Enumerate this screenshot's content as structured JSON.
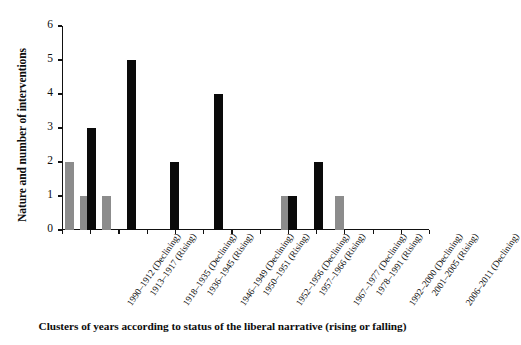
{
  "chart_data": {
    "type": "bar",
    "title": "",
    "xlabel": "Clusters of years according to status of the liberal narrative (rising or falling)",
    "ylabel": "Nature and number of interventions",
    "ylim": [
      0,
      6
    ],
    "yticks": [
      0,
      1,
      2,
      3,
      4,
      5,
      6
    ],
    "grid": false,
    "legend": "none",
    "categories": [
      "1990–1912 (Declining)",
      "1913–1917 (Rising)",
      "1918–1935 (Declining)",
      "1936–1945 (Rising)",
      "1946–1949 (Declining)",
      "1950–1951 (Rising)",
      "1952–1956 (Declining)",
      "1957–1966 (Rising)",
      "1967–1977 (Declining)",
      "1978–1991 (Rising)",
      "1992–2000 (Declining)",
      "2001–2005 (Rising)",
      "2006–2011 (Declining)"
    ],
    "series": [
      {
        "name": "Declining",
        "color": "#8c8c8c",
        "values": [
          2,
          1,
          1,
          0,
          0,
          0,
          0,
          0,
          0,
          0,
          1,
          0,
          1
        ]
      },
      {
        "name": "Rising",
        "color": "#0a0a0a",
        "values": [
          0,
          3,
          0,
          5,
          0,
          2,
          0,
          4,
          0,
          0,
          1,
          2,
          0
        ]
      }
    ],
    "bars": [
      {
        "category_index": 0,
        "status": "Declining",
        "value": 2,
        "color": "#8c8c8c",
        "x_pct": 3.0
      },
      {
        "category_index": 1,
        "status": "Declining",
        "value": 1,
        "color": "#8c8c8c",
        "x_pct": 18.0
      },
      {
        "category_index": 1,
        "status": "Rising",
        "value": 3,
        "color": "#0a0a0a",
        "x_pct": 25.0
      },
      {
        "category_index": 2,
        "status": "Declining",
        "value": 1,
        "color": "#8c8c8c",
        "x_pct": 39.5
      },
      {
        "category_index": 3,
        "status": "Rising",
        "value": 5,
        "color": "#0a0a0a",
        "x_pct": 65.0
      },
      {
        "category_index": 5,
        "status": "Rising",
        "value": 2,
        "color": "#0a0a0a",
        "x_pct": 108.0
      },
      {
        "category_index": 7,
        "status": "Rising",
        "value": 4,
        "color": "#0a0a0a",
        "x_pct": 152.0
      },
      {
        "category_index": 10,
        "status": "Declining",
        "value": 1,
        "color": "#8c8c8c",
        "x_pct": 219.0
      },
      {
        "category_index": 10,
        "status": "Rising",
        "value": 1,
        "color": "#0a0a0a",
        "x_pct": 226.0
      },
      {
        "category_index": 11,
        "status": "Rising",
        "value": 2,
        "color": "#0a0a0a",
        "x_pct": 252.0
      },
      {
        "category_index": 12,
        "status": "Declining",
        "value": 1,
        "color": "#8c8c8c",
        "x_pct": 273.0
      }
    ]
  }
}
